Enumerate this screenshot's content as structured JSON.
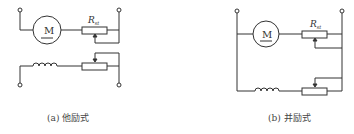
{
  "diagrams": [
    {
      "id": "a",
      "caption": "(a) 他励式",
      "motor_label": "M",
      "resistor_label": "R",
      "resistor_subscript": "st"
    },
    {
      "id": "b",
      "caption": "(b) 并励式",
      "motor_label": "M",
      "resistor_label": "R",
      "resistor_subscript": "st"
    }
  ],
  "colors": {
    "line": "#333333",
    "caption": "#444444",
    "background": "#ffffff"
  }
}
